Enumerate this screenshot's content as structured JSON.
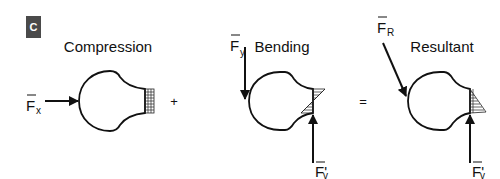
{
  "figure": {
    "panel_label": "C",
    "operators": {
      "plus": "+",
      "equals": "="
    }
  },
  "diagrams": [
    {
      "title": "Compression",
      "forces": [
        {
          "symbol": "F",
          "subscript": "x",
          "direction": "right"
        }
      ],
      "stress_distribution": "uniform"
    },
    {
      "title": "Bending",
      "forces": [
        {
          "symbol": "F",
          "subscript": "y",
          "direction": "down"
        },
        {
          "symbol": "F'",
          "subscript": "v",
          "direction": "up"
        }
      ],
      "stress_distribution": "linear-triangular"
    },
    {
      "title": "Resultant",
      "forces": [
        {
          "symbol": "F",
          "subscript": "R",
          "direction": "down-right"
        },
        {
          "symbol": "F'",
          "subscript": "v",
          "direction": "up"
        }
      ],
      "stress_distribution": "triangular"
    }
  ]
}
